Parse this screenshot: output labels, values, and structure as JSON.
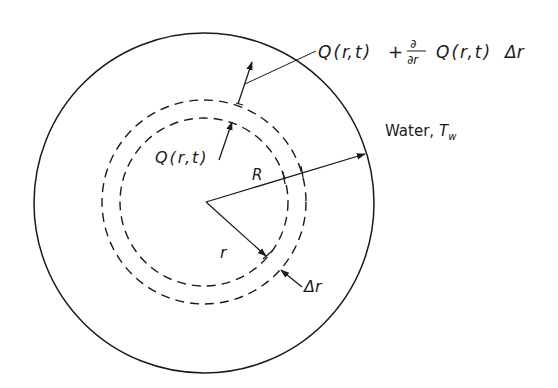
{
  "figure": {
    "colors": {
      "background": "#ffffff",
      "stroke": "#1a1a1a"
    },
    "outer_circle": {
      "cx": 204,
      "cy": 203,
      "r": 170
    },
    "shell_inner_dashed": {
      "cx": 204,
      "cy": 202,
      "r": 84
    },
    "shell_outer_dashed": {
      "cx": 204,
      "cy": 202,
      "r": 102
    },
    "center": {
      "x": 206,
      "y": 202
    }
  },
  "labels": {
    "outflow_Q": "Q",
    "outflow_paren_open": "(",
    "outflow_r": "r",
    "outflow_comma": ",",
    "outflow_t": "t",
    "outflow_paren_close": ")",
    "outflow_plus": "+",
    "outflow_partial_num": "∂",
    "outflow_partial_den": "∂r",
    "outflow_Q2": "Q(r,t)",
    "outflow_delta_r": "Δr",
    "outflow_full": "Q(r,t) + ∂/∂r Q(r,t) Δr",
    "inflow": "Q(r,t)",
    "water": "Water,",
    "water_T": "T",
    "water_sub": "w",
    "radius_R": "R",
    "radius_r": "r",
    "shell_thickness": "Δr"
  }
}
